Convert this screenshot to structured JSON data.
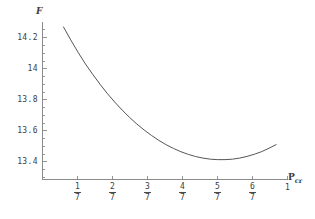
{
  "chart_data": {
    "type": "line",
    "title": "",
    "subtitle": "",
    "xlabel": "Pcr",
    "xlabel_base": "P",
    "xlabel_sub": "cr",
    "ylabel": "F",
    "grid": false,
    "legend": "none",
    "xlim": [
      0.0714,
      1.0714
    ],
    "ylim": [
      13.29,
      14.29
    ],
    "x_tick_labels": [
      "1/7",
      "2/7",
      "3/7",
      "4/7",
      "5/7",
      "6/7",
      "1"
    ],
    "x_tick_values": [
      0.142857,
      0.285714,
      0.428571,
      0.571429,
      0.714286,
      0.857143,
      1.0
    ],
    "x_tick_numerators": [
      "1",
      "2",
      "3",
      "4",
      "5",
      "6",
      ""
    ],
    "x_tick_denominators": [
      "7",
      "7",
      "7",
      "7",
      "7",
      "7",
      ""
    ],
    "y_tick_labels": [
      "14.2",
      "14",
      "13.8",
      "13.6",
      "13.4"
    ],
    "y_tick_values": [
      14.2,
      14.0,
      13.8,
      13.6,
      13.4
    ],
    "series": [
      {
        "name": "F",
        "x": [
          0.085,
          0.115,
          0.145,
          0.175,
          0.205,
          0.235,
          0.265,
          0.295,
          0.325,
          0.355,
          0.385,
          0.415,
          0.445,
          0.475,
          0.505,
          0.535,
          0.565,
          0.595,
          0.625,
          0.655,
          0.685,
          0.715,
          0.745,
          0.775,
          0.805,
          0.835,
          0.865,
          0.895,
          0.925,
          0.955
        ],
        "y": [
          14.27,
          14.185,
          14.105,
          14.03,
          13.962,
          13.898,
          13.838,
          13.783,
          13.732,
          13.685,
          13.642,
          13.603,
          13.568,
          13.536,
          13.508,
          13.484,
          13.463,
          13.446,
          13.432,
          13.422,
          13.415,
          13.412,
          13.412,
          13.415,
          13.422,
          13.433,
          13.447,
          13.464,
          13.486,
          13.51
        ]
      }
    ],
    "minimum": {
      "x": 0.73,
      "y": 13.412
    },
    "curve_color": "#555555",
    "axis_color": "#6e6e6e",
    "background_color": "#ffffff"
  },
  "geometry": {
    "axis_x_px": 42,
    "axis_y_px": 179,
    "plot_right_px": 300,
    "plot_top_px": 22
  }
}
